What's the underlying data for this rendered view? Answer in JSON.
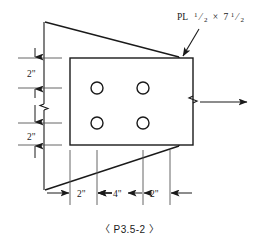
{
  "drawing": {
    "background_color": "#ffffff",
    "line_color": "#1a1a1a",
    "caption": "〈 P3.5-2 〉",
    "plate_label": {
      "prefix": "PL",
      "thickness_num": "1",
      "thickness_den": "2",
      "times": "×",
      "width_whole": "7",
      "width_num": "1",
      "width_den": "2",
      "full_text": "PL 1/2 × 7 1/2"
    },
    "vertical_dimensions": [
      {
        "name": "top-edge-distance",
        "value": "2\""
      },
      {
        "name": "bottom-edge-distance",
        "value": "2\""
      }
    ],
    "horizontal_dimensions": [
      {
        "name": "left-edge-distance",
        "value": "2\""
      },
      {
        "name": "bolt-spacing",
        "value": "4\""
      },
      {
        "name": "right-edge-distance",
        "value": "2\""
      }
    ],
    "bolt_holes": [
      {
        "name": "bolt-hole-top-left",
        "cx": 97,
        "cy": 88,
        "r": 6
      },
      {
        "name": "bolt-hole-top-right",
        "cx": 143,
        "cy": 88,
        "r": 6
      },
      {
        "name": "bolt-hole-bottom-left",
        "cx": 97,
        "cy": 123,
        "r": 6
      },
      {
        "name": "bolt-hole-bottom-right",
        "cx": 143,
        "cy": 123,
        "r": 6
      }
    ],
    "plate_rect": {
      "x": 70,
      "y": 58,
      "width": 123,
      "height": 87
    },
    "reference_line_x": 44,
    "load_arrow": {
      "name": "load-direction-arrow",
      "from_x": 200,
      "to_x": 247,
      "y": 102
    }
  }
}
